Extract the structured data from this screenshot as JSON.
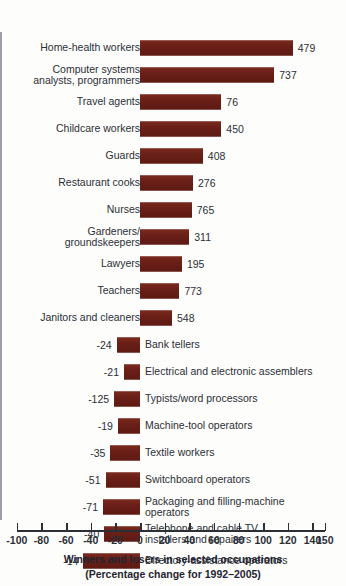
{
  "chart_data": {
    "type": "bar",
    "orientation": "horizontal",
    "title": "Winners and losers in selected occupations",
    "subtitle": "(Percentage change for 1992–2005)",
    "xlabel": "",
    "ylabel": "",
    "xlim": [
      -100,
      150
    ],
    "grid": false,
    "legend": "none",
    "bar_color": "#6b2018",
    "axis_color": "#9aa0a6",
    "tick_labels": [
      "-100",
      "-80",
      "-60",
      "-40",
      "-20",
      "0",
      "20",
      "40",
      "60",
      "80",
      "100",
      "120",
      "140",
      "150"
    ],
    "tick_values": [
      -100,
      -80,
      -60,
      -40,
      -20,
      0,
      20,
      40,
      60,
      80,
      100,
      120,
      140,
      150
    ],
    "note": "value_label is the printed figure beside each bar (thousands of jobs); percent is the bar length read off the x-axis (percentage change 1992-2005)",
    "categories": [
      "Home-health workers",
      "Computer systems\nanalysts, programmers",
      "Travel agents",
      "Childcare workers",
      "Guards",
      "Restaurant cooks",
      "Nurses",
      "Gardeners/\ngroundskeepers",
      "Lawyers",
      "Teachers",
      "Janitors and cleaners",
      "Bank tellers",
      "Electrical and electronic assemblers",
      "Typists/word processors",
      "Machine-tool operators",
      "Textile workers",
      "Switchboard operators",
      "Packaging and filling-machine\noperators",
      "Telephone and cable TV\ninstallers and repairers",
      "Directory-assistance operators"
    ],
    "value_labels": [
      "479",
      "737",
      "76",
      "450",
      "408",
      "276",
      "765",
      "311",
      "195",
      "773",
      "548",
      "-24",
      "-21",
      "-125",
      "-19",
      "-35",
      "-51",
      "-71",
      "-40",
      "-14"
    ],
    "percents": [
      124,
      109,
      66,
      66,
      51,
      43,
      42,
      40,
      34,
      32,
      26,
      -19,
      -13,
      -21,
      -18,
      -24,
      -28,
      -30,
      -29,
      -46
    ]
  },
  "rows": [
    {
      "label": "Home-health workers",
      "value_label": "479",
      "percent": 124
    },
    {
      "label": "Computer systems\nanalysts, programmers",
      "value_label": "737",
      "percent": 109
    },
    {
      "label": "Travel agents",
      "value_label": "76",
      "percent": 66
    },
    {
      "label": "Childcare workers",
      "value_label": "450",
      "percent": 66
    },
    {
      "label": "Guards",
      "value_label": "408",
      "percent": 51
    },
    {
      "label": "Restaurant cooks",
      "value_label": "276",
      "percent": 43
    },
    {
      "label": "Nurses",
      "value_label": "765",
      "percent": 42
    },
    {
      "label": "Gardeners/\ngroundskeepers",
      "value_label": "311",
      "percent": 40
    },
    {
      "label": "Lawyers",
      "value_label": "195",
      "percent": 34
    },
    {
      "label": "Teachers",
      "value_label": "773",
      "percent": 32
    },
    {
      "label": "Janitors and cleaners",
      "value_label": "548",
      "percent": 26
    },
    {
      "label": "Bank tellers",
      "value_label": "-24",
      "percent": -19
    },
    {
      "label": "Electrical and electronic assemblers",
      "value_label": "-21",
      "percent": -13
    },
    {
      "label": "Typists/word processors",
      "value_label": "-125",
      "percent": -21
    },
    {
      "label": "Machine-tool operators",
      "value_label": "-19",
      "percent": -18
    },
    {
      "label": "Textile workers",
      "value_label": "-35",
      "percent": -24
    },
    {
      "label": "Switchboard operators",
      "value_label": "-51",
      "percent": -28
    },
    {
      "label": "Packaging and filling-machine\noperators",
      "value_label": "-71",
      "percent": -30
    },
    {
      "label": "Telephone and cable TV\ninstallers and repairers",
      "value_label": "-40",
      "percent": -29
    },
    {
      "label": "Directory-assistance operators",
      "value_label": "-14",
      "percent": -46
    }
  ],
  "axis": {
    "ticks": [
      {
        "label": "-100",
        "value": -100
      },
      {
        "label": "-80",
        "value": -80
      },
      {
        "label": "-60",
        "value": -60
      },
      {
        "label": "-40",
        "value": -40
      },
      {
        "label": "-20",
        "value": -20
      },
      {
        "label": "0",
        "value": 0
      },
      {
        "label": "20",
        "value": 20
      },
      {
        "label": "40",
        "value": 40
      },
      {
        "label": "60",
        "value": 60
      },
      {
        "label": "80",
        "value": 80
      },
      {
        "label": "100",
        "value": 100
      },
      {
        "label": "120",
        "value": 120
      },
      {
        "label": "140",
        "value": 140
      },
      {
        "label": "150",
        "value": 150
      }
    ]
  },
  "caption": {
    "line1": "Winners and losers in selected occupations",
    "line2": "(Percentage change for 1992–2005)"
  }
}
